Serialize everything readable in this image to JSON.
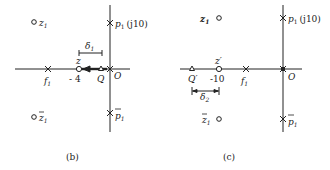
{
  "panel_b": {
    "caption": "(b)",
    "z1": "z",
    "z1_sub": "1",
    "z1bar": "z",
    "p1": "p",
    "p1_sub": "1",
    "p1_suffix": "(j10)",
    "p1bar": "p",
    "f1": "f",
    "f1_sub": "1",
    "z_label": "z",
    "z_value": "- 4",
    "q_label": "Q",
    "origin": "O",
    "delta": "δ",
    "delta_sub": "1"
  },
  "panel_c": {
    "caption": "(c)",
    "z1": "z",
    "z1_sub": "1",
    "z1bar": "z",
    "p1": "p",
    "p1_sub": "1",
    "p1_suffix": "(j10)",
    "p1bar": "p",
    "f1": "f",
    "f1_sub": "1",
    "zprime_label": "z′",
    "zprime_value": "-10",
    "qprime_label": "Q′",
    "origin": "O",
    "delta": "δ",
    "delta_sub": "2"
  }
}
